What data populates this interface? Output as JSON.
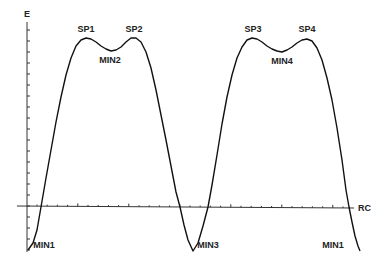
{
  "chart_data": {
    "type": "line",
    "title": "",
    "xlabel": "RC",
    "ylabel": "E",
    "grid": false,
    "legend": null,
    "axis_origin_px": {
      "x": 27,
      "y": 207
    },
    "x_axis_px": {
      "x_start": 17,
      "x_end": 354,
      "tick_spacing": 10.2
    },
    "y_axis_px": {
      "y_top": 22,
      "y_bottom": 252,
      "tick_spacing": 11
    },
    "series": [
      {
        "name": "E(RC)",
        "points_px": [
          [
            28,
            250
          ],
          [
            33,
            243
          ],
          [
            37,
            230
          ],
          [
            41,
            207
          ],
          [
            46,
            178
          ],
          [
            51,
            150
          ],
          [
            56,
            122
          ],
          [
            61,
            97
          ],
          [
            66,
            75
          ],
          [
            71,
            58
          ],
          [
            76,
            46
          ],
          [
            81,
            40
          ],
          [
            86,
            38
          ],
          [
            91,
            39
          ],
          [
            96,
            42
          ],
          [
            101,
            46
          ],
          [
            106,
            49
          ],
          [
            111,
            51
          ],
          [
            116,
            50
          ],
          [
            121,
            47
          ],
          [
            126,
            42
          ],
          [
            131,
            38
          ],
          [
            136,
            38
          ],
          [
            141,
            42
          ],
          [
            146,
            52
          ],
          [
            151,
            68
          ],
          [
            156,
            90
          ],
          [
            161,
            115
          ],
          [
            166,
            140
          ],
          [
            171,
            166
          ],
          [
            176,
            192
          ],
          [
            180,
            207
          ],
          [
            184,
            225
          ],
          [
            188,
            240
          ],
          [
            193,
            251
          ],
          [
            198,
            243
          ],
          [
            203,
            226
          ],
          [
            208,
            207
          ],
          [
            212,
            185
          ],
          [
            217,
            155
          ],
          [
            222,
            124
          ],
          [
            227,
            97
          ],
          [
            232,
            75
          ],
          [
            237,
            58
          ],
          [
            242,
            47
          ],
          [
            247,
            40
          ],
          [
            252,
            38
          ],
          [
            257,
            39
          ],
          [
            262,
            42
          ],
          [
            267,
            46
          ],
          [
            272,
            49
          ],
          [
            277,
            51
          ],
          [
            282,
            52
          ],
          [
            287,
            50
          ],
          [
            292,
            47
          ],
          [
            297,
            43
          ],
          [
            302,
            40
          ],
          [
            307,
            39
          ],
          [
            312,
            41
          ],
          [
            317,
            48
          ],
          [
            322,
            60
          ],
          [
            327,
            78
          ],
          [
            332,
            100
          ],
          [
            337,
            128
          ],
          [
            342,
            160
          ],
          [
            346,
            190
          ],
          [
            349,
            207
          ],
          [
            352,
            222
          ],
          [
            355,
            236
          ],
          [
            358,
            246
          ],
          [
            360,
            251
          ]
        ]
      }
    ],
    "annotations": [
      {
        "text": "SP1",
        "x": 86,
        "y": 32
      },
      {
        "text": "SP2",
        "x": 134,
        "y": 32
      },
      {
        "text": "MIN2",
        "x": 110,
        "y": 63
      },
      {
        "text": "SP3",
        "x": 253,
        "y": 32
      },
      {
        "text": "SP4",
        "x": 307,
        "y": 32
      },
      {
        "text": "MIN4",
        "x": 282,
        "y": 64
      },
      {
        "text": "MIN1",
        "x": 44,
        "y": 248
      },
      {
        "text": "MIN3",
        "x": 208,
        "y": 248
      },
      {
        "text": "MIN1",
        "x": 333,
        "y": 248
      }
    ],
    "features": {
      "saddle_points": [
        "SP1",
        "SP2",
        "SP3",
        "SP4"
      ],
      "minima": [
        "MIN1",
        "MIN2",
        "MIN3",
        "MIN4",
        "MIN1"
      ]
    }
  },
  "labels": {
    "y_axis": "E",
    "x_axis": "RC"
  }
}
